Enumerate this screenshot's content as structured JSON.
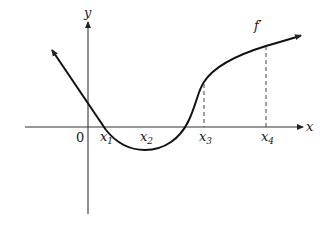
{
  "diagram": {
    "function_label": "f′",
    "axes": {
      "x_label": "x",
      "y_label": "y",
      "origin_label": "0"
    },
    "points": [
      {
        "name": "x1",
        "base": "x",
        "sub": "1"
      },
      {
        "name": "x2",
        "base": "x",
        "sub": "2"
      },
      {
        "name": "x3",
        "base": "x",
        "sub": "3"
      },
      {
        "name": "x4",
        "base": "x",
        "sub": "4"
      }
    ],
    "colors": {
      "curve": "#111111",
      "axis": "#333333",
      "dashed": "#444444",
      "background": "#ffffff"
    }
  }
}
